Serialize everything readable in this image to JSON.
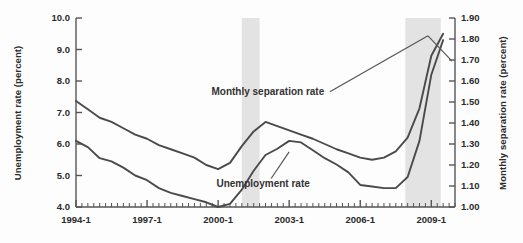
{
  "chart_data": {
    "type": "line",
    "title": "",
    "xlabel": "",
    "ylabel": "Unemployment rate (percent)",
    "y2label": "Monthly separation rate (percent)",
    "ylim": [
      4.0,
      10.0
    ],
    "y2lim": [
      1.0,
      1.9
    ],
    "grid": false,
    "legend_position": "inline-annotations",
    "x_tick_labels": [
      "1994-1",
      "1997-1",
      "2000-1",
      "2003-1",
      "2006-1",
      "2009-1"
    ],
    "x_tick_values": [
      1994.0,
      1997.0,
      2000.0,
      2003.0,
      2006.0,
      2009.0
    ],
    "x_minor_tick_interval_quarters": 1,
    "y_tick_labels": [
      "4.0",
      "5.0",
      "6.0",
      "7.0",
      "8.0",
      "9.0",
      "10.0"
    ],
    "y_tick_values": [
      4.0,
      5.0,
      6.0,
      7.0,
      8.0,
      9.0,
      10.0
    ],
    "y2_tick_labels": [
      "1.00",
      "1.10",
      "1.20",
      "1.30",
      "1.40",
      "1.50",
      "1.60",
      "1.70",
      "1.80",
      "1.90"
    ],
    "y2_tick_values": [
      1.0,
      1.1,
      1.2,
      1.3,
      1.4,
      1.5,
      1.6,
      1.7,
      1.8,
      1.9
    ],
    "xlim": [
      1994.0,
      2010.0
    ],
    "annotations": [
      {
        "name": "separation-rate-label",
        "text": "Monthly separation rate",
        "x": 2002.1,
        "y": 7.55
      },
      {
        "name": "unemployment-rate-label",
        "text": "Unemployment rate",
        "x": 2001.9,
        "y": 4.62
      }
    ],
    "shaded_regions": [
      {
        "name": "recession-2001",
        "x_start": 2001.0,
        "x_end": 2001.75,
        "color": "#e3e3e3"
      },
      {
        "name": "recession-2008",
        "x_start": 2007.9,
        "x_end": 2009.4,
        "color": "#e3e3e3"
      }
    ],
    "series": [
      {
        "name": "Unemployment rate",
        "axis": "left",
        "color": "#4a4a4a",
        "x": [
          1994.0,
          1994.5,
          1995.0,
          1995.5,
          1996.0,
          1996.5,
          1997.0,
          1997.5,
          1998.0,
          1998.5,
          1999.0,
          1999.5,
          2000.0,
          2000.5,
          2001.0,
          2001.5,
          2002.0,
          2002.5,
          2003.0,
          2003.5,
          2004.0,
          2004.5,
          2005.0,
          2005.5,
          2006.0,
          2006.5,
          2007.0,
          2007.5,
          2008.0,
          2008.5,
          2009.0,
          2009.5
        ],
        "values": [
          6.1,
          5.9,
          5.55,
          5.45,
          5.25,
          5.0,
          4.85,
          4.6,
          4.45,
          4.35,
          4.25,
          4.15,
          4.0,
          4.1,
          4.55,
          5.15,
          5.65,
          5.85,
          6.1,
          6.05,
          5.8,
          5.55,
          5.35,
          5.1,
          4.7,
          4.65,
          4.6,
          4.6,
          4.95,
          6.1,
          8.2,
          9.3
        ]
      },
      {
        "name": "Monthly separation rate",
        "axis": "right",
        "color": "#4a4a4a",
        "x": [
          1994.0,
          1994.5,
          1995.0,
          1995.5,
          1996.0,
          1996.5,
          1997.0,
          1997.5,
          1998.0,
          1998.5,
          1999.0,
          1999.5,
          2000.0,
          2000.5,
          2001.0,
          2001.5,
          2002.0,
          2002.5,
          2003.0,
          2003.5,
          2004.0,
          2004.5,
          2005.0,
          2005.5,
          2006.0,
          2006.5,
          2007.0,
          2007.5,
          2008.0,
          2008.5,
          2009.0,
          2009.5
        ],
        "values": [
          1.505,
          1.465,
          1.425,
          1.405,
          1.375,
          1.345,
          1.325,
          1.295,
          1.275,
          1.255,
          1.235,
          1.2,
          1.18,
          1.21,
          1.29,
          1.36,
          1.405,
          1.385,
          1.365,
          1.345,
          1.325,
          1.3,
          1.275,
          1.255,
          1.235,
          1.225,
          1.235,
          1.265,
          1.33,
          1.47,
          1.72,
          1.825
        ]
      }
    ]
  },
  "axes": {
    "left_title": "Unemployment rate (percent)",
    "right_title": "Monthly separation rate (percent)"
  }
}
